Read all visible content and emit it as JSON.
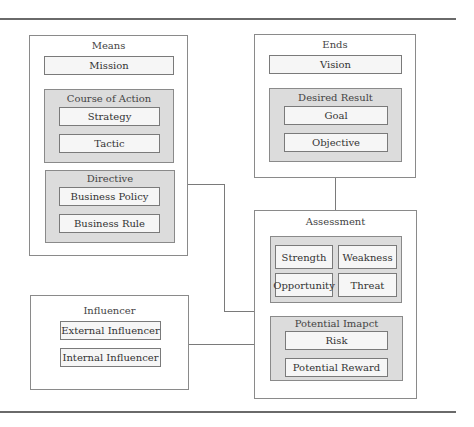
{
  "diagram": {
    "means": {
      "title": "Means",
      "mission": "Mission",
      "course_of_action": {
        "title": "Course of Action",
        "items": [
          "Strategy",
          "Tactic"
        ]
      },
      "directive": {
        "title": "Directive",
        "items": [
          "Business Policy",
          "Business Rule"
        ]
      }
    },
    "ends": {
      "title": "Ends",
      "vision": "Vision",
      "desired_result": {
        "title": "Desired Result",
        "items": [
          "Goal",
          "Objective"
        ]
      }
    },
    "assessment": {
      "title": "Assessment",
      "swot": [
        "Strength",
        "Weakness",
        "Opportunity",
        "Threat"
      ],
      "potential_impact": {
        "title": "Potential Imapct",
        "items": [
          "Risk",
          "Potential Reward"
        ]
      }
    },
    "influencer": {
      "title": "Influencer",
      "items": [
        "External Influencer",
        "Internal Influencer"
      ]
    }
  },
  "colors": {
    "group_fill": "#dcdcdc",
    "item_fill": "#f6f6f6",
    "border": "#8a8a8a"
  }
}
